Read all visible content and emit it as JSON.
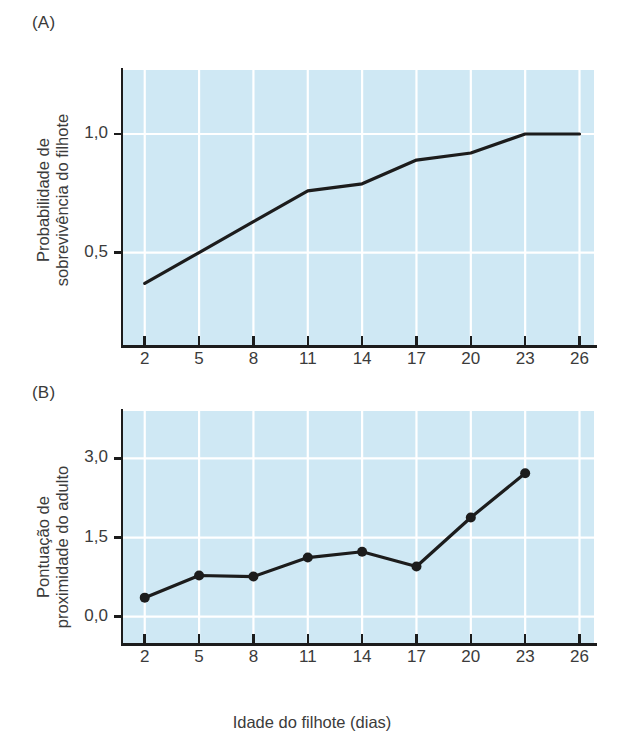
{
  "figure": {
    "panels": [
      {
        "id": "A",
        "label": "(A)",
        "ylabel_line1": "Probabilidade de",
        "ylabel_line2": "sobrevivência do filhote"
      },
      {
        "id": "B",
        "label": "(B)",
        "ylabel_line1": "Pontuação de",
        "ylabel_line2": "proximidade do adulto"
      }
    ],
    "xlabel": "Idade do filhote (dias)",
    "colors": {
      "plot_background": "#cfe8f4",
      "gridline": "#ffffff",
      "line": "#1c1c1c",
      "axis": "#1c1c1c",
      "text": "#3b3b3b"
    }
  },
  "chart_data": [
    {
      "type": "line",
      "panel": "A",
      "title": "(A)",
      "xlabel": "Idade do filhote (dias)",
      "ylabel": "Probabilidade de sobrevivência do filhote",
      "x": [
        2,
        5,
        8,
        11,
        14,
        17,
        20,
        23,
        26
      ],
      "xticklabels": [
        "2",
        "5",
        "8",
        "11",
        "14",
        "17",
        "20",
        "23",
        "26"
      ],
      "values": [
        0.37,
        0.5,
        0.63,
        0.76,
        0.79,
        0.89,
        0.92,
        1.0,
        1.0
      ],
      "yticks": [
        0.5,
        1.0
      ],
      "yticklabels": [
        "0,5",
        "1,0"
      ],
      "xlim": [
        0.8,
        26.8
      ],
      "ylim": [
        0.11,
        1.27
      ],
      "grid": true,
      "markers": false,
      "legend": null
    },
    {
      "type": "line",
      "panel": "B",
      "title": "(B)",
      "xlabel": "Idade do filhote (dias)",
      "ylabel": "Pontuação de proximidade do adulto",
      "x": [
        2,
        5,
        8,
        11,
        14,
        17,
        20,
        23
      ],
      "xticklabels": [
        "2",
        "5",
        "8",
        "11",
        "14",
        "17",
        "20",
        "23",
        "26"
      ],
      "values": [
        0.36,
        0.78,
        0.76,
        1.12,
        1.23,
        0.95,
        1.88,
        2.72
      ],
      "yticks": [
        0.0,
        1.5,
        3.0
      ],
      "yticklabels": [
        "0,0",
        "1,5",
        "3,0"
      ],
      "xlim": [
        0.8,
        26.8
      ],
      "ylim": [
        -0.5,
        3.9
      ],
      "grid": true,
      "markers": true,
      "legend": null
    }
  ]
}
